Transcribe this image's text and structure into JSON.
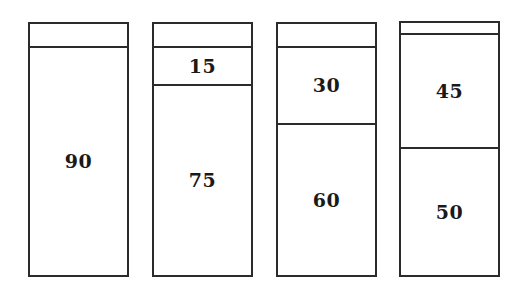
{
  "chart_data": {
    "type": "bar",
    "title": "",
    "subtitle": "",
    "xlabel": "",
    "ylabel": "",
    "grid": false,
    "legend": null,
    "axis_visible": false,
    "stacked": true,
    "total_per_bar": 100,
    "ylim": [
      0,
      100
    ],
    "categories": [
      "Bar 1",
      "Bar 2",
      "Bar 3",
      "Bar 4"
    ],
    "series": [
      {
        "name": "Bottom segment",
        "values": [
          90,
          75,
          60,
          50
        ]
      },
      {
        "name": "Middle segment",
        "values": [
          null,
          15,
          30,
          45
        ]
      },
      {
        "name": "Top segment",
        "values": [
          10,
          10,
          10,
          5
        ]
      }
    ],
    "bars": [
      {
        "id": "bar-1",
        "total": 100,
        "segments": [
          {
            "label": "",
            "value": 10,
            "labeled": false
          },
          {
            "label": "90",
            "value": 90,
            "labeled": true
          }
        ]
      },
      {
        "id": "bar-2",
        "total": 100,
        "segments": [
          {
            "label": "",
            "value": 10,
            "labeled": false
          },
          {
            "label": "15",
            "value": 15,
            "labeled": true
          },
          {
            "label": "75",
            "value": 75,
            "labeled": true
          }
        ]
      },
      {
        "id": "bar-3",
        "total": 100,
        "segments": [
          {
            "label": "",
            "value": 10,
            "labeled": false
          },
          {
            "label": "30",
            "value": 30,
            "labeled": true
          },
          {
            "label": "60",
            "value": 60,
            "labeled": true
          }
        ]
      },
      {
        "id": "bar-4",
        "total": 100,
        "segments": [
          {
            "label": "",
            "value": 5,
            "labeled": false
          },
          {
            "label": "45",
            "value": 45,
            "labeled": true
          },
          {
            "label": "50",
            "value": 50,
            "labeled": true
          }
        ]
      }
    ]
  },
  "style": {
    "stroke_color": "#2b2b2b",
    "fill_color": "#ffffff",
    "label_color": "#1a1a1a",
    "background": "#ffffff"
  },
  "geometry": {
    "bar_width": 101,
    "bar_tops": [
      22,
      22,
      22,
      21
    ],
    "bar_bottom": 277,
    "bar_lefts": [
      28,
      152,
      276,
      399
    ],
    "dividers": [
      [
        48
      ],
      [
        48,
        86
      ],
      [
        48,
        125
      ],
      [
        35,
        149
      ]
    ]
  }
}
